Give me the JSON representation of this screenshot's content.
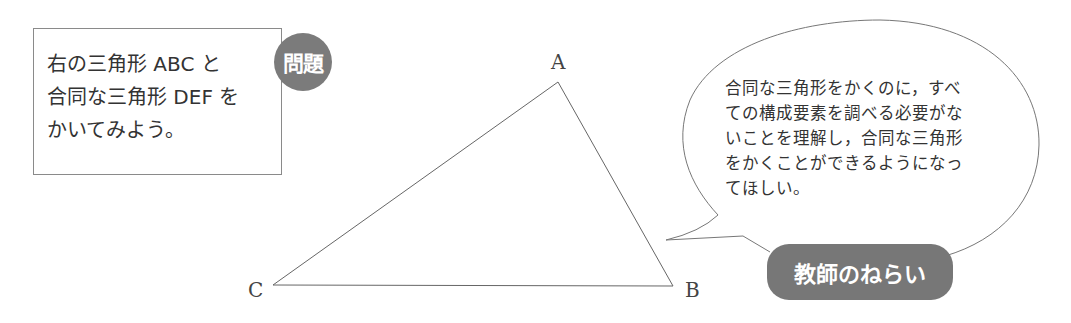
{
  "problem": {
    "lines": [
      "右の三角形 ABC と",
      "合同な三角形 DEF を",
      "かいてみよう。"
    ],
    "badge_label": "問題"
  },
  "triangle": {
    "vertices": {
      "A": {
        "label": "A",
        "x": 558,
        "y": 82
      },
      "B": {
        "label": "B",
        "x": 673,
        "y": 286
      },
      "C": {
        "label": "C",
        "x": 273,
        "y": 285
      }
    }
  },
  "teacher_aim": {
    "lines": [
      "合同な三角形をかくのに，すべ",
      "ての構成要素を調べる必要がな",
      "いことを理解し，合同な三角形",
      "をかくことができるようになっ",
      "てほしい。"
    ],
    "badge_label": "教師のねらい"
  },
  "colors": {
    "badge": "#777777",
    "line": "#666666",
    "text": "#333333"
  }
}
